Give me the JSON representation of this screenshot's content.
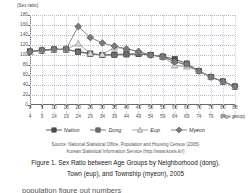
{
  "chart_data": {
    "type": "line",
    "title": "",
    "ylabel": "(Sex ratio)",
    "xlabel": "(Age group)",
    "ylim": [
      0,
      180
    ],
    "ytick_step": 20,
    "yticks": [
      0,
      20,
      40,
      60,
      80,
      100,
      120,
      140,
      160,
      180
    ],
    "grid": true,
    "legend_position": "bottom",
    "categories": [
      "0-4",
      "5-9",
      "10-14",
      "15-19",
      "20-24",
      "25-29",
      "30-34",
      "35-39",
      "40-44",
      "45-49",
      "50-54",
      "55-59",
      "60-64",
      "65-69",
      "70-74",
      "75-79",
      "80-84",
      "85+"
    ],
    "category_lower": [
      "0",
      "5",
      "10",
      "15",
      "20",
      "25",
      "30",
      "35",
      "40",
      "45",
      "50",
      "55",
      "60",
      "65",
      "70",
      "75",
      "80",
      "85"
    ],
    "category_upper": [
      "4",
      "9",
      "14",
      "19",
      "24",
      "29",
      "34",
      "39",
      "44",
      "49",
      "54",
      "59",
      "64",
      "69",
      "74",
      "79",
      "84",
      "+"
    ],
    "series": [
      {
        "name": "Nation",
        "marker": "square",
        "color": "#4a4a4a",
        "values": [
          107,
          109,
          111,
          111,
          107,
          103,
          100,
          101,
          102,
          102,
          100,
          97,
          92,
          83,
          68,
          56,
          47,
          37
        ]
      },
      {
        "name": "Dong",
        "marker": "square",
        "color": "#6e6e6e",
        "values": [
          107,
          109,
          111,
          111,
          106,
          102,
          100,
          100,
          101,
          102,
          100,
          96,
          88,
          79,
          68,
          56,
          47,
          37
        ]
      },
      {
        "name": "Eup",
        "marker": "triangle",
        "color": "#9a9a9a",
        "values": [
          107,
          109,
          111,
          111,
          123,
          103,
          101,
          115,
          113,
          107,
          100,
          97,
          79,
          77,
          68,
          56,
          47,
          37
        ]
      },
      {
        "name": "Myeon",
        "marker": "diamond",
        "color": "#7a7a7a",
        "values": [
          107,
          110,
          112,
          112,
          157,
          135,
          124,
          118,
          112,
          107,
          100,
          97,
          86,
          82,
          68,
          56,
          47,
          37
        ]
      }
    ]
  },
  "legend": {
    "items": [
      {
        "label": "Nation"
      },
      {
        "label": "Dong"
      },
      {
        "label": "Eup"
      },
      {
        "label": "Myeon"
      }
    ]
  },
  "source": {
    "line1": "Source: National Statistical Office, Population and Housing Census (2005)",
    "line2": "Korean Statistical Information Service (http://www.kosis.kr/)"
  },
  "caption": {
    "line1": "Figure 1. Sex Ratio between Age Groups by Neighborhood (dong),",
    "line2": "Town (eup), and Township (myeon), 2005"
  }
}
